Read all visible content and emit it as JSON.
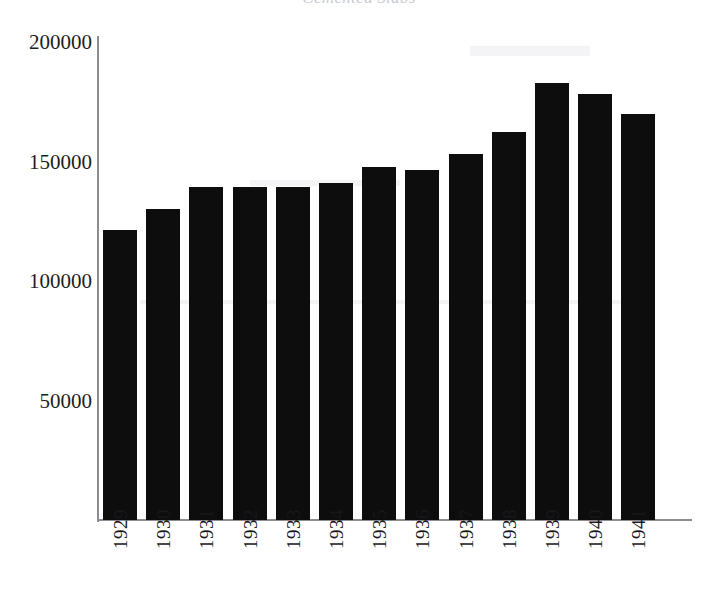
{
  "chart_data": {
    "type": "bar",
    "title": "Cemented Slabs",
    "xlabel": "",
    "ylabel": "",
    "categories": [
      "1929",
      "1930",
      "1931",
      "1932",
      "1933",
      "1934",
      "1935",
      "1936",
      "1937",
      "1938",
      "1939",
      "1940",
      "1941"
    ],
    "values": [
      122000,
      130500,
      140000,
      140000,
      140000,
      141500,
      148200,
      147000,
      153500,
      163000,
      183500,
      178500,
      170500
    ],
    "series": [
      {
        "name": "Cemented Slabs",
        "values": [
          122000,
          130500,
          140000,
          140000,
          140000,
          141500,
          148200,
          147000,
          153500,
          163000,
          183500,
          178500,
          170500
        ]
      }
    ],
    "ylim": [
      0,
      210000
    ],
    "ytick_values": [
      50000,
      100000,
      150000,
      200000
    ],
    "ytick_labels": [
      "50000",
      "100000",
      "150000",
      "200000"
    ],
    "grid": false,
    "legend": false,
    "legend_position": "none",
    "bar_color": "#0d0d0d",
    "axis_color": "#8c8c92",
    "background_color": "#ffffff"
  }
}
